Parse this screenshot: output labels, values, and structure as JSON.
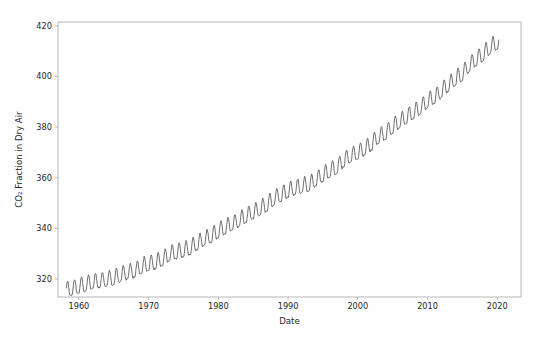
{
  "figure": {
    "background_color": "#ffffff",
    "width": 538,
    "height": 343
  },
  "axes": {
    "spine_color": "#b0b0b0",
    "tick_color": "#b0b0b0",
    "label_color": "#262626",
    "left": 58,
    "top": 22,
    "right": 521,
    "bottom": 297
  },
  "chart_data": {
    "type": "line",
    "title": "",
    "xlabel": "Date",
    "ylabel": "CO₂ Fraction in Dry Air",
    "xlim": [
      1957.0,
      2023.4
    ],
    "ylim": [
      312.9,
      421.5
    ],
    "xticks": [
      1960,
      1970,
      1980,
      1990,
      2000,
      2010,
      2020
    ],
    "xticklabels": [
      "1960",
      "1970",
      "1980",
      "1990",
      "2000",
      "2010",
      "2020"
    ],
    "yticks": [
      320,
      340,
      360,
      380,
      400,
      420
    ],
    "yticklabels": [
      "320",
      "340",
      "360",
      "380",
      "400",
      "420"
    ],
    "grid": false,
    "legend": null,
    "series": [
      {
        "name": "Mauna Loa monthly mean CO2",
        "color": "#555555",
        "linewidth": 0.85,
        "description": "Keeling curve: monthly mean atmospheric CO2 concentration with seasonal sawtooth oscillation superimposed on a rising trend",
        "x_start": 1958.2,
        "x_end": 2020.2,
        "seasonal_amplitude_ppm": 3.1,
        "seasonal_peak_month": 5,
        "seasonal_trough_month": 10,
        "annual_trend_points": [
          {
            "year": 1958,
            "value": 315.0
          },
          {
            "year": 1959,
            "value": 315.9
          },
          {
            "year": 1960,
            "value": 316.9
          },
          {
            "year": 1961,
            "value": 317.6
          },
          {
            "year": 1962,
            "value": 318.4
          },
          {
            "year": 1963,
            "value": 318.9
          },
          {
            "year": 1964,
            "value": 319.6
          },
          {
            "year": 1965,
            "value": 320.0
          },
          {
            "year": 1966,
            "value": 321.4
          },
          {
            "year": 1967,
            "value": 322.2
          },
          {
            "year": 1968,
            "value": 323.0
          },
          {
            "year": 1969,
            "value": 324.6
          },
          {
            "year": 1970,
            "value": 325.7
          },
          {
            "year": 1971,
            "value": 326.3
          },
          {
            "year": 1972,
            "value": 327.5
          },
          {
            "year": 1973,
            "value": 329.7
          },
          {
            "year": 1974,
            "value": 330.2
          },
          {
            "year": 1975,
            "value": 331.1
          },
          {
            "year": 1976,
            "value": 332.0
          },
          {
            "year": 1977,
            "value": 333.8
          },
          {
            "year": 1978,
            "value": 335.4
          },
          {
            "year": 1979,
            "value": 336.8
          },
          {
            "year": 1980,
            "value": 338.7
          },
          {
            "year": 1981,
            "value": 340.1
          },
          {
            "year": 1982,
            "value": 341.4
          },
          {
            "year": 1983,
            "value": 343.0
          },
          {
            "year": 1984,
            "value": 344.6
          },
          {
            "year": 1985,
            "value": 346.0
          },
          {
            "year": 1986,
            "value": 347.4
          },
          {
            "year": 1987,
            "value": 349.2
          },
          {
            "year": 1988,
            "value": 351.6
          },
          {
            "year": 1989,
            "value": 353.1
          },
          {
            "year": 1990,
            "value": 354.4
          },
          {
            "year": 1991,
            "value": 355.6
          },
          {
            "year": 1992,
            "value": 356.4
          },
          {
            "year": 1993,
            "value": 357.1
          },
          {
            "year": 1994,
            "value": 358.8
          },
          {
            "year": 1995,
            "value": 360.8
          },
          {
            "year": 1996,
            "value": 362.6
          },
          {
            "year": 1997,
            "value": 363.7
          },
          {
            "year": 1998,
            "value": 366.7
          },
          {
            "year": 1999,
            "value": 368.4
          },
          {
            "year": 2000,
            "value": 369.5
          },
          {
            "year": 2001,
            "value": 371.1
          },
          {
            "year": 2002,
            "value": 373.2
          },
          {
            "year": 2003,
            "value": 375.8
          },
          {
            "year": 2004,
            "value": 377.5
          },
          {
            "year": 2005,
            "value": 379.8
          },
          {
            "year": 2006,
            "value": 381.9
          },
          {
            "year": 2007,
            "value": 383.8
          },
          {
            "year": 2008,
            "value": 385.6
          },
          {
            "year": 2009,
            "value": 387.4
          },
          {
            "year": 2010,
            "value": 389.9
          },
          {
            "year": 2011,
            "value": 391.6
          },
          {
            "year": 2012,
            "value": 393.8
          },
          {
            "year": 2013,
            "value": 396.5
          },
          {
            "year": 2014,
            "value": 398.6
          },
          {
            "year": 2015,
            "value": 400.8
          },
          {
            "year": 2016,
            "value": 404.2
          },
          {
            "year": 2017,
            "value": 406.5
          },
          {
            "year": 2018,
            "value": 408.5
          },
          {
            "year": 2019,
            "value": 411.4
          },
          {
            "year": 2020,
            "value": 413.0
          }
        ]
      }
    ]
  }
}
